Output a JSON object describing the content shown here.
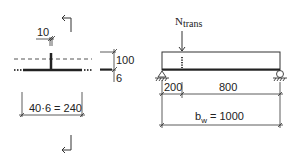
{
  "diagram": {
    "cross_section": {
      "rib_width_label": "10",
      "rib_height_label": "100",
      "plate_thickness_label": "6",
      "effective_width_label": "40·6 = 240",
      "section_marker_top": "section-arrow",
      "section_marker_bottom": "section-arrow"
    },
    "elevation": {
      "load_label_main": "N",
      "load_label_sub": "trans",
      "left_segment_label": "200",
      "right_segment_label": "800",
      "total_width_main": "b",
      "total_width_sub": "w",
      "total_width_value": " = 1000",
      "left_support": "pin-support",
      "right_support": "roller-support"
    },
    "colors": {
      "line": "#222222",
      "background": "#ffffff",
      "dash": "#555555"
    }
  }
}
